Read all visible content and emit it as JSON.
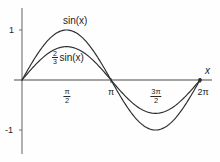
{
  "chart_data": {
    "type": "line",
    "title": "",
    "xlabel": "x",
    "ylabel": "",
    "grid": false,
    "legend": "inline-annotations",
    "xlim": [
      0,
      6.283185307179586
    ],
    "ylim": [
      -1.25,
      1.25
    ],
    "x_tick_values": [
      1.5707963267948966,
      3.141592653589793,
      4.71238898038469,
      6.283185307179586
    ],
    "x_tick_labels": [
      "π/2",
      "π",
      "3π/2",
      "2π"
    ],
    "y_tick_values": [
      1,
      -1
    ],
    "y_tick_labels": [
      "1",
      "-1"
    ],
    "series": [
      {
        "name": "sin(x)",
        "amplitude": 1,
        "color": "#2b2b2b",
        "x": [
          0,
          0.3141592653589793,
          0.6283185307179586,
          0.9424777960769379,
          1.2566370614359172,
          1.5707963267948966,
          1.8849555921538759,
          2.199114857512855,
          2.5132741228718345,
          2.827433388230814,
          3.141592653589793,
          3.455751918948772,
          3.7699111843077517,
          4.084070449666731,
          4.39822971502571,
          4.71238898038469,
          5.026548245743669,
          5.340707511102648,
          5.654866776461628,
          5.969026041820607,
          6.283185307179586
        ],
        "y": [
          0,
          0.309,
          0.588,
          0.809,
          0.951,
          1,
          0.951,
          0.809,
          0.588,
          0.309,
          0,
          -0.309,
          -0.588,
          -0.809,
          -0.951,
          -1,
          -0.951,
          -0.809,
          -0.588,
          -0.309,
          0
        ]
      },
      {
        "name": "2/3 sin(x)",
        "amplitude": 0.6666666666666666,
        "color": "#2b2b2b",
        "x": [
          0,
          0.3141592653589793,
          0.6283185307179586,
          0.9424777960769379,
          1.2566370614359172,
          1.5707963267948966,
          1.8849555921538759,
          2.199114857512855,
          2.5132741228718345,
          2.827433388230814,
          3.141592653589793,
          3.455751918948772,
          3.7699111843077517,
          4.084070449666731,
          4.39822971502571,
          4.71238898038469,
          5.026548245743669,
          5.340707511102648,
          5.654866776461628,
          5.969026041820607,
          6.283185307179586
        ],
        "y": [
          0,
          0.206,
          0.392,
          0.539,
          0.634,
          0.667,
          0.634,
          0.539,
          0.392,
          0.206,
          0,
          -0.206,
          -0.392,
          -0.539,
          -0.634,
          -0.667,
          -0.634,
          -0.539,
          -0.392,
          -0.206,
          0
        ]
      }
    ],
    "annotations": [
      {
        "text": "sin(x)",
        "x": 1.35,
        "y": 1.15
      },
      {
        "text": "2/3 sin(x)",
        "x": 1.3,
        "y": 0.62
      }
    ]
  },
  "labels": {
    "curve_outer": "sin(x)",
    "coef_numerator": "2",
    "coef_denominator": "3",
    "curve_inner_fn": "sin(x)",
    "axis_x_name": "x",
    "y_tick_one": "1",
    "y_tick_minus_one": "-1",
    "tick_pi_over_2_num": "π",
    "tick_pi_over_2_den": "2",
    "tick_pi": "π",
    "tick_3pi_over_2_num": "3π",
    "tick_3pi_over_2_den": "2",
    "tick_2pi": "2π"
  },
  "style": {
    "curve_color": "#2b2b2b",
    "axis_color": "#4a4a4a",
    "background": "#fefefe"
  }
}
